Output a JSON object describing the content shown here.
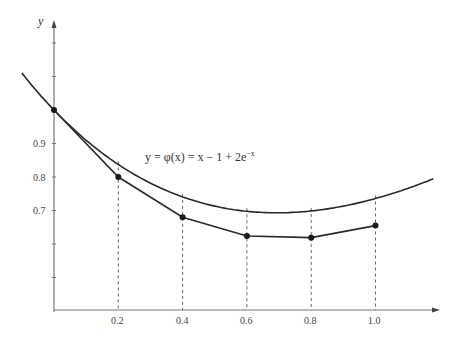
{
  "chart_data": {
    "type": "line",
    "title": "",
    "xlabel": "",
    "ylabel": "y",
    "xlim": [
      0,
      1.2
    ],
    "ylim": [
      0.4,
      1.2
    ],
    "x_ticks": [
      "0.2",
      "0.4",
      "0.6",
      "0.8",
      "1.0"
    ],
    "y_ticks": [
      "0.7",
      "0.8",
      "0.9"
    ],
    "grid": false,
    "annotation": "y = φ(x) = x − 1 + 2e^{−x}",
    "series": [
      {
        "name": "exact solution φ(x) = x − 1 + 2e^{−x}",
        "style": "smooth curve",
        "x_range": [
          -0.1,
          1.2
        ]
      },
      {
        "name": "Euler approximation (h = 0.2)",
        "style": "polyline with markers",
        "x": [
          0,
          0.2,
          0.4,
          0.6,
          0.8,
          1.0
        ],
        "values": [
          1.0,
          0.8,
          0.68,
          0.624,
          0.619,
          0.655
        ]
      }
    ],
    "dashed_verticals_at": [
      0.2,
      0.4,
      0.6,
      0.8,
      1.0
    ]
  },
  "labels": {
    "y_axis": "y",
    "equation_prefix": "y = φ(x) = x − 1 + 2e",
    "equation_exp": "−x",
    "x_tick_0": "0.2",
    "x_tick_1": "0.4",
    "x_tick_2": "0.6",
    "x_tick_3": "0.8",
    "x_tick_4": "1.0",
    "y_tick_0": "0.9",
    "y_tick_1": "0.8",
    "y_tick_2": "0.7"
  },
  "colors": {
    "line": "#2a2a2a",
    "axis": "#666666",
    "dash": "#555555"
  }
}
